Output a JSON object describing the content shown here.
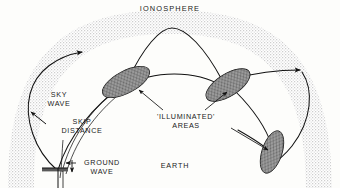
{
  "figure": {
    "title": "IONOSPHERE"
  },
  "labels": {
    "ionosphere": "IONOSPHERE",
    "sky_wave_line1": "SKY",
    "sky_wave_line2": "WAVE",
    "skip_distance_line1": "SKIP",
    "skip_distance_line2": "DISTANCE",
    "ground_wave_line1": "GROUND",
    "ground_wave_line2": "WAVE",
    "illuminated_line1": "'ILLUMINATED'",
    "illuminated_line2": "AREAS",
    "earth": "EARTH"
  },
  "colors": {
    "ink": "#111111",
    "background": "#fdfdfb",
    "ionosphere_band": "#d9d9d9",
    "illuminated_fill": "#8f8f8f",
    "hatch": "#222222"
  },
  "elements": {
    "ionosphere_band_name": "ionosphere-band",
    "earth_ground_name": "transmitter-ground",
    "illuminated_areas": [
      {
        "name": "illuminated-area-left",
        "tilt_deg": -28
      },
      {
        "name": "illuminated-area-right",
        "tilt_deg": -32
      },
      {
        "name": "illuminated-area-lower-right",
        "tilt_deg": -72
      }
    ],
    "wave_paths": [
      {
        "name": "sky-wave-path-left-outbound"
      },
      {
        "name": "sky-wave-path-to-first-reflection"
      },
      {
        "name": "sky-wave-hop-upper-arc"
      },
      {
        "name": "sky-wave-hop-lower-arc"
      },
      {
        "name": "sky-wave-path-right-outbound"
      },
      {
        "name": "sky-wave-path-descending-right"
      },
      {
        "name": "ground-wave-path"
      },
      {
        "name": "skip-distance-path"
      }
    ]
  }
}
